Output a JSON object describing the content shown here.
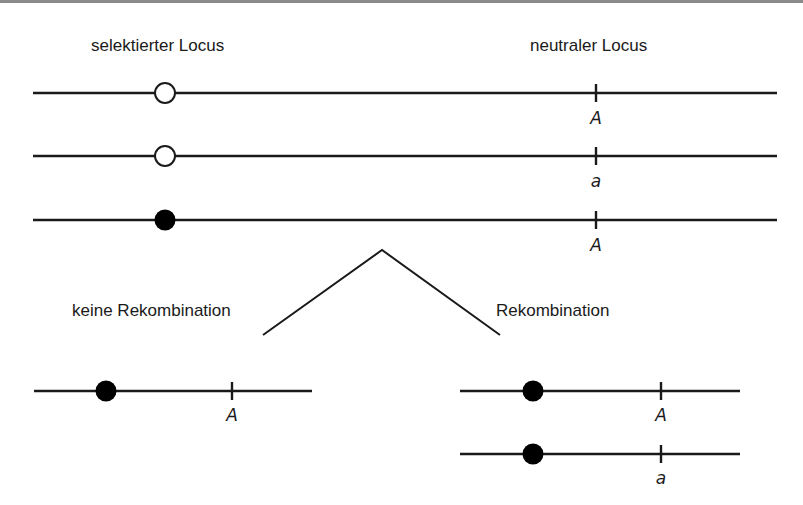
{
  "labels": {
    "selected_locus": "selektierter Locus",
    "neutral_locus": "neutraler Locus",
    "no_recombination": "keine Rekombination",
    "recombination": "Rekombination"
  },
  "colors": {
    "line": "#1a1a1a",
    "border": "#8a8a8a",
    "open_allele_fill": "#ffffff",
    "selected_allele_fill": "#000000"
  },
  "top_chromosomes": [
    {
      "selected_allele": "open",
      "neutral_allele": "A"
    },
    {
      "selected_allele": "open",
      "neutral_allele": "a"
    },
    {
      "selected_allele": "filled",
      "neutral_allele": "A"
    }
  ],
  "no_recombination_chromosomes": [
    {
      "selected_allele": "filled",
      "neutral_allele": "A"
    }
  ],
  "recombination_chromosomes": [
    {
      "selected_allele": "filled",
      "neutral_allele": "A"
    },
    {
      "selected_allele": "filled",
      "neutral_allele": "a"
    }
  ]
}
